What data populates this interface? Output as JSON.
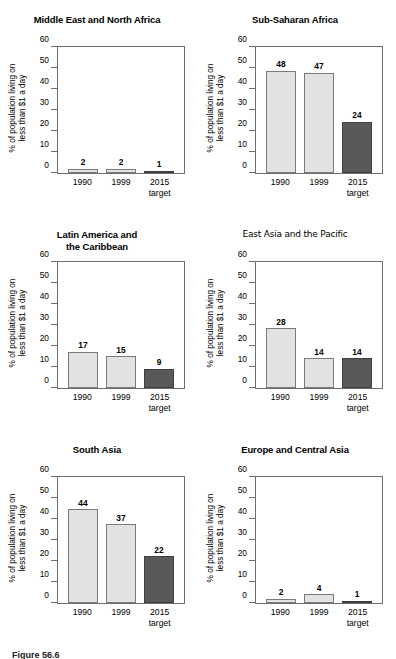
{
  "figure": {
    "caption": "Figure 56.6"
  },
  "axis": {
    "y_label_line1": "% of population living on",
    "y_label_line2": "less than $1 a day",
    "y_ticks": [
      0,
      10,
      20,
      30,
      40,
      50,
      60
    ],
    "x_categories": [
      "1990",
      "1999",
      "2015"
    ],
    "x_sub_labels": [
      "",
      "",
      "target"
    ]
  },
  "colors": {
    "bar_light": "#e2e2e2",
    "bar_dark": "#595959",
    "bar_light_border": "#7a7a7a",
    "bar_dark_border": "#3f3f3f",
    "frame": "#6e6e6e",
    "text": "#000000"
  },
  "chart_data": [
    {
      "type": "bar",
      "title": "Middle East and North Africa",
      "title_line2": "",
      "title_style": "bold",
      "categories": [
        "1990",
        "1999",
        "2015 target"
      ],
      "values": [
        2,
        2,
        1
      ],
      "xlabel": "",
      "ylabel": "% of population living on less than $1 a day",
      "ylim": [
        0,
        60
      ],
      "grid": false,
      "legend": "none"
    },
    {
      "type": "bar",
      "title": "Sub-Saharan Africa",
      "title_line2": "",
      "title_style": "bold",
      "categories": [
        "1990",
        "1999",
        "2015 target"
      ],
      "values": [
        48,
        47,
        24
      ],
      "xlabel": "",
      "ylabel": "% of population living on less than $1 a day",
      "ylim": [
        0,
        60
      ],
      "grid": false,
      "legend": "none"
    },
    {
      "type": "bar",
      "title": "Latin America and",
      "title_line2": "the Caribbean",
      "title_style": "bold",
      "categories": [
        "1990",
        "1999",
        "2015 target"
      ],
      "values": [
        17,
        15,
        9
      ],
      "xlabel": "",
      "ylabel": "% of population living on less than $1 a day",
      "ylim": [
        0,
        60
      ],
      "grid": false,
      "legend": "none"
    },
    {
      "type": "bar",
      "title": "East Asia and the Pacific",
      "title_line2": "",
      "title_style": "regular",
      "categories": [
        "1990",
        "1999",
        "2015 target"
      ],
      "values": [
        28,
        14,
        14
      ],
      "xlabel": "",
      "ylabel": "% of population living on less than $1 a day",
      "ylim": [
        0,
        60
      ],
      "grid": false,
      "legend": "none"
    },
    {
      "type": "bar",
      "title": "South Asia",
      "title_line2": "",
      "title_style": "bold",
      "categories": [
        "1990",
        "1999",
        "2015 target"
      ],
      "values": [
        44,
        37,
        22
      ],
      "xlabel": "",
      "ylabel": "% of population living on less than $1 a day",
      "ylim": [
        0,
        60
      ],
      "grid": false,
      "legend": "none"
    },
    {
      "type": "bar",
      "title": "Europe and Central Asia",
      "title_line2": "",
      "title_style": "bold",
      "categories": [
        "1990",
        "1999",
        "2015 target"
      ],
      "values": [
        2,
        4,
        1
      ],
      "xlabel": "",
      "ylabel": "% of population living on less than $1 a day",
      "ylim": [
        0,
        60
      ],
      "grid": false,
      "legend": "none"
    }
  ]
}
